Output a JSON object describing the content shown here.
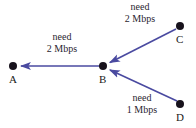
{
  "diagram": {
    "type": "node-link-diagram",
    "canvas": {
      "width": 196,
      "height": 128,
      "background": "#ffffff"
    },
    "style": {
      "edge_color": "#4a4aa0",
      "node_color": "#17121c",
      "text_color": "#2b2530",
      "node_radius": 4,
      "edge_width": 1.6
    },
    "nodes": [
      {
        "id": "A",
        "label": "A",
        "x": 13,
        "y": 66,
        "label_x": 9,
        "label_y": 74
      },
      {
        "id": "B",
        "label": "B",
        "x": 103,
        "y": 66,
        "label_x": 99,
        "label_y": 74
      },
      {
        "id": "C",
        "label": "C",
        "x": 180,
        "y": 26,
        "label_x": 176,
        "label_y": 34
      },
      {
        "id": "D",
        "label": "D",
        "x": 180,
        "y": 104,
        "label_x": 176,
        "label_y": 112
      }
    ],
    "edges": [
      {
        "id": "B-A",
        "from": "B",
        "to": "A",
        "direction": "B to A",
        "x1": 100,
        "y1": 66,
        "x2": 20,
        "y2": 66
      },
      {
        "id": "C-B",
        "from": "C",
        "to": "B",
        "direction": "C to B",
        "x1": 176,
        "y1": 29,
        "x2": 109,
        "y2": 62
      },
      {
        "id": "D-B",
        "from": "D",
        "to": "B",
        "direction": "D to B",
        "x1": 177,
        "y1": 101,
        "x2": 109,
        "y2": 70
      }
    ],
    "edge_labels": [
      {
        "id": "label-B-A",
        "for_edge": "B-A",
        "line1": "need",
        "line2": "2 Mbps",
        "x": 62,
        "y": 31
      },
      {
        "id": "label-C-B",
        "for_edge": "C-B",
        "line1": "need",
        "line2": "2 Mbps",
        "x": 140,
        "y": 1
      },
      {
        "id": "label-D-B",
        "for_edge": "D-B",
        "line1": "need",
        "line2": "1 Mbps",
        "x": 142,
        "y": 92
      }
    ]
  }
}
